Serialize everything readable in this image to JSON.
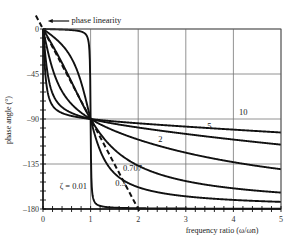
{
  "chart_data": {
    "type": "line",
    "title": "",
    "xlabel": "frequency ratio (ω/ωn)",
    "ylabel": "phase angle (°)",
    "xlim": [
      0,
      5
    ],
    "ylim": [
      -180,
      0
    ],
    "x_ticks": [
      0,
      1,
      2,
      3,
      4,
      5
    ],
    "x_tick_labels": [
      "0",
      "1",
      "2",
      "3",
      "4",
      "5"
    ],
    "y_ticks": [
      0,
      -45,
      -90,
      -135,
      -180
    ],
    "y_tick_labels": [
      "0",
      "–45",
      "–90",
      "–135",
      "–180"
    ],
    "grid": true,
    "formula": "phase = -atan2(2*zeta*r, 1 - r^2)",
    "series": [
      {
        "name": "ζ = 0.01",
        "zeta": 0.01,
        "label": "ζ = 0.01",
        "label_pos": [
          0.35,
          -160
        ]
      },
      {
        "name": "0.3",
        "zeta": 0.3,
        "label": "0.3",
        "label_pos": [
          1.52,
          -157
        ]
      },
      {
        "name": "0.707",
        "zeta": 0.707,
        "label": "0.707",
        "label_pos": [
          1.68,
          -142
        ]
      },
      {
        "name": "2",
        "zeta": 2,
        "label": "2",
        "label_pos": [
          2.42,
          -113
        ]
      },
      {
        "name": "5",
        "zeta": 5,
        "label": "5",
        "label_pos": [
          3.45,
          -100
        ]
      },
      {
        "name": "10",
        "zeta": 10,
        "label": "10",
        "label_pos": [
          4.12,
          -86
        ]
      }
    ],
    "reference_line": {
      "name": "phase linearity",
      "style": "dashed",
      "points": [
        [
          -0.15,
          13.5
        ],
        [
          2.05,
          -184.5
        ]
      ]
    },
    "annotations": [
      {
        "text": "phase linearity",
        "pos": [
          0.6,
          9
        ]
      }
    ]
  }
}
